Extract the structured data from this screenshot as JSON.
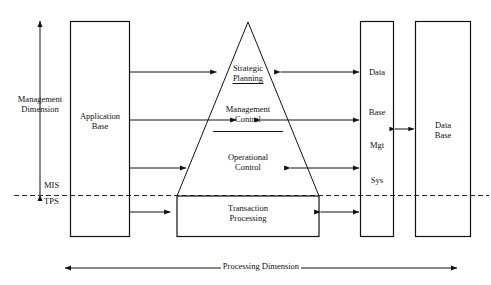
{
  "diagram": {
    "axes": {
      "vertical": {
        "name": "management-dimension-axis",
        "label_line1": "Management",
        "label_line2": "Dimension",
        "arrow": "double-headed-vertical"
      },
      "horizontal": {
        "name": "processing-dimension-axis",
        "label": "Processing Dimension",
        "arrow": "double-headed-horizontal"
      }
    },
    "threshold": {
      "above_label": "MIS",
      "below_label": "TPS",
      "line_style": "dashed"
    },
    "boxes": {
      "application_base": {
        "line1": "Application",
        "line2": "Base"
      },
      "dbms": {
        "line1": "Data",
        "line2": "Base",
        "line3": "Mgt",
        "line4": "Sys"
      },
      "database": {
        "line1": "Data",
        "line2": "Base"
      }
    },
    "pyramid": {
      "levels": [
        {
          "line1": "Strategic",
          "line2": "Planning"
        },
        {
          "line1": "Management",
          "line2": "Control"
        },
        {
          "line1": "Operational",
          "line2": "Control"
        },
        {
          "line1": "Transaction",
          "line2": "Processing"
        }
      ]
    },
    "colors": {
      "stroke": "#111111",
      "background": "#ffffff"
    }
  }
}
